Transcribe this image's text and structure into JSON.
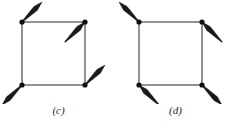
{
  "figure": {
    "background_color": "#ffffff",
    "line_color": "#3a3a3a",
    "arrow_color": "#1a1a1a",
    "dot_color": "#111111",
    "caption_color": "#262626",
    "width": 234,
    "height": 130
  },
  "panels": [
    {
      "id": "c",
      "caption": "(c)",
      "square": {
        "x": 22,
        "y": 22,
        "size": 63
      },
      "corners": [
        {
          "name": "top-left",
          "cx": 22,
          "cy": 22,
          "arrow_direction": "up-right",
          "head_at": "tip",
          "dx": 20,
          "dy": -20
        },
        {
          "name": "top-right",
          "cx": 85,
          "cy": 22,
          "arrow_direction": "up-right",
          "head_at": "corner",
          "dx": -20,
          "dy": 20
        },
        {
          "name": "bottom-left",
          "cx": 22,
          "cy": 85,
          "arrow_direction": "down-left",
          "head_at": "tip",
          "dx": -20,
          "dy": 20
        },
        {
          "name": "bottom-right",
          "cx": 85,
          "cy": 85,
          "arrow_direction": "up-right",
          "head_at": "tip",
          "dx": 20,
          "dy": -20
        }
      ]
    },
    {
      "id": "d",
      "caption": "(d)",
      "square": {
        "x": 22,
        "y": 22,
        "size": 63
      },
      "corners": [
        {
          "name": "top-left",
          "cx": 22,
          "cy": 22,
          "arrow_direction": "up-left",
          "head_at": "tip",
          "dx": -20,
          "dy": -20
        },
        {
          "name": "top-right",
          "cx": 85,
          "cy": 22,
          "arrow_direction": "up-left",
          "head_at": "corner",
          "dx": 20,
          "dy": 20
        },
        {
          "name": "bottom-left",
          "cx": 22,
          "cy": 85,
          "arrow_direction": "up-left",
          "head_at": "corner",
          "dx": 20,
          "dy": 20
        },
        {
          "name": "bottom-right",
          "cx": 85,
          "cy": 85,
          "arrow_direction": "down-right",
          "head_at": "tip",
          "dx": 20,
          "dy": 20
        }
      ]
    }
  ]
}
